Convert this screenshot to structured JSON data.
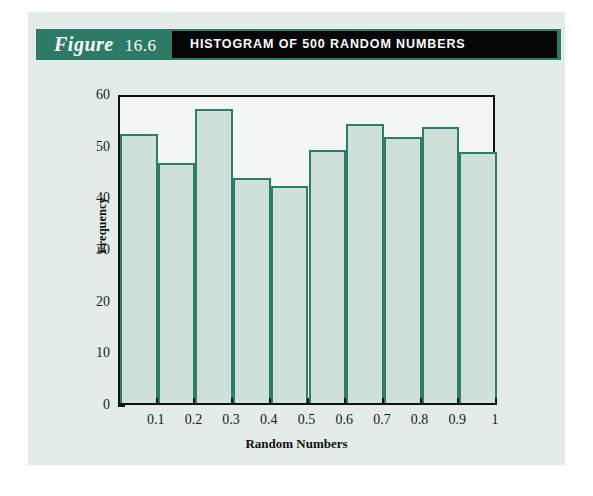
{
  "figure": {
    "label_word": "Figure",
    "label_number": "16.6",
    "title": "HISTOGRAM OF 500 RANDOM NUMBERS",
    "colors": {
      "header_teal": "#2d7a66",
      "header_black": "#050505",
      "panel_background": "#e3ece9",
      "bar_fill": "#cfe0d8",
      "bar_stroke": "#2e7d6b",
      "plot_background": "#f2f7f5",
      "axis": "#111111"
    }
  },
  "chart_data": {
    "type": "bar",
    "title": "HISTOGRAM OF 500 RANDOM NUMBERS",
    "xlabel": "Random Numbers",
    "ylabel": "Frequency",
    "categories": [
      "0.0-0.1",
      "0.1-0.2",
      "0.2-0.3",
      "0.3-0.4",
      "0.4-0.5",
      "0.5-0.6",
      "0.6-0.7",
      "0.7-0.8",
      "0.8-0.9",
      "0.9-1.0"
    ],
    "bin_edges": [
      0,
      0.1,
      0.2,
      0.3,
      0.4,
      0.5,
      0.6,
      0.7,
      0.8,
      0.9,
      1
    ],
    "values": [
      52,
      46.5,
      57,
      43.5,
      42,
      49,
      54,
      51.5,
      53.5,
      48.5
    ],
    "total_observations": 500,
    "ylim": [
      0,
      60
    ],
    "xlim": [
      0,
      1
    ],
    "yticks": [
      0,
      10,
      20,
      30,
      40,
      50,
      60
    ],
    "ytick_labels": [
      "0",
      "10",
      "20",
      "30",
      "40",
      "50",
      "60"
    ],
    "xticks": [
      0.1,
      0.2,
      0.3,
      0.4,
      0.5,
      0.6,
      0.7,
      0.8,
      0.9,
      1
    ],
    "xtick_labels": [
      "0.1",
      "0.2",
      "0.3",
      "0.4",
      "0.5",
      "0.6",
      "0.7",
      "0.8",
      "0.9",
      "1"
    ],
    "grid": false,
    "legend": false
  }
}
